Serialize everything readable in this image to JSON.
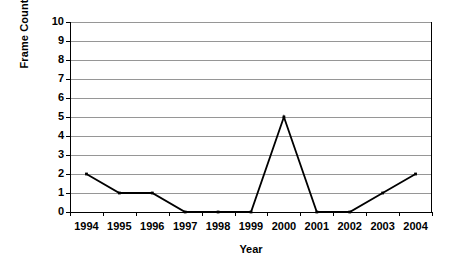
{
  "chart_data": {
    "type": "line",
    "title": "",
    "xlabel": "Year",
    "ylabel": "Frame Count",
    "categories": [
      "1994",
      "1995",
      "1996",
      "1997",
      "1998",
      "1999",
      "2000",
      "2001",
      "2002",
      "2003",
      "2004"
    ],
    "values": [
      2,
      1,
      1,
      0,
      0,
      0,
      5,
      0,
      0,
      1,
      2
    ],
    "series": [
      {
        "name": "Frame Count",
        "values": [
          2,
          1,
          1,
          0,
          0,
          0,
          5,
          0,
          0,
          1,
          2
        ]
      }
    ],
    "ylim": [
      0,
      10
    ],
    "y_ticks": [
      0,
      1,
      2,
      3,
      4,
      5,
      6,
      7,
      8,
      9,
      10
    ],
    "y_tick_labels": [
      "0",
      "1",
      "2",
      "3",
      "4",
      "5",
      "6",
      "7",
      "8",
      "9",
      "10"
    ],
    "grid": "horizontal",
    "legend": "none",
    "colors": {
      "line": "#000000",
      "marker": "#000000",
      "gridline": "#969696",
      "axis": "#000000",
      "background": "#ffffff",
      "text": "#000000"
    }
  }
}
